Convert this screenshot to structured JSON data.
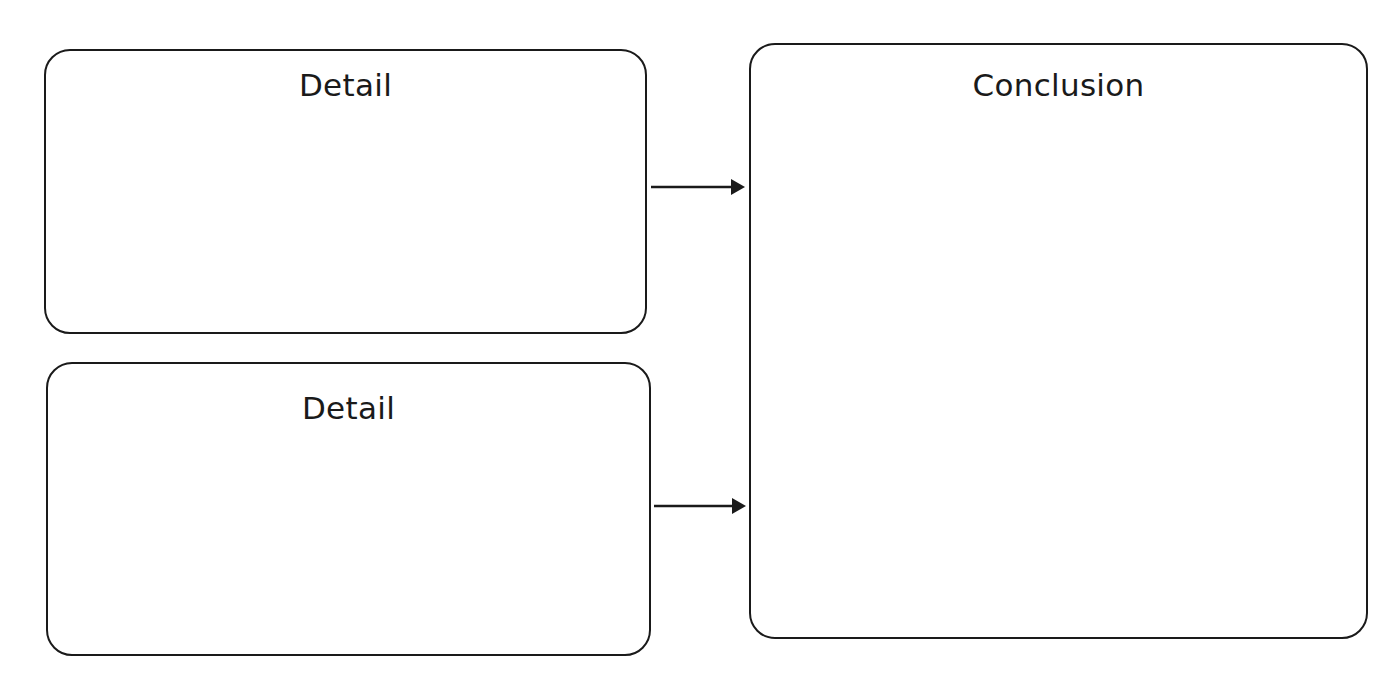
{
  "diagram": {
    "boxes": [
      {
        "id": "detail-1",
        "title": "Detail"
      },
      {
        "id": "detail-2",
        "title": "Detail"
      },
      {
        "id": "conclusion",
        "title": "Conclusion"
      }
    ],
    "arrows": [
      {
        "from": "detail-1",
        "to": "conclusion"
      },
      {
        "from": "detail-2",
        "to": "conclusion"
      }
    ],
    "colors": {
      "stroke": "#1a1a1a",
      "background": "#ffffff"
    }
  }
}
